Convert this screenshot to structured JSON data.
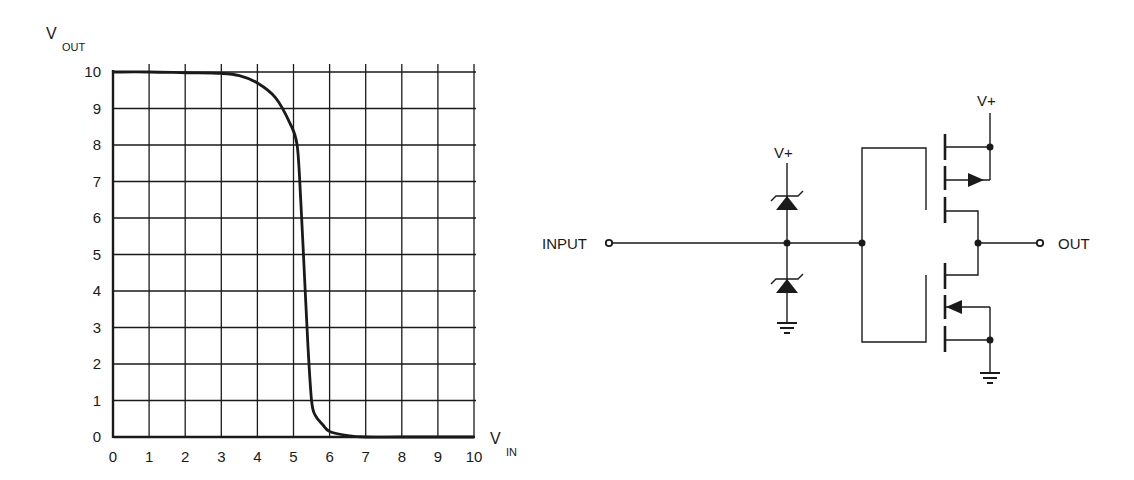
{
  "chart_data": {
    "type": "line",
    "title": "",
    "xlabel": "V",
    "xlabel_sub": "IN",
    "ylabel": "V",
    "ylabel_sub": "OUT",
    "xlim": [
      0,
      10
    ],
    "ylim": [
      0,
      10
    ],
    "grid": true,
    "xticks": [
      "0",
      "1",
      "2",
      "3",
      "4",
      "5",
      "6",
      "7",
      "8",
      "9",
      "10"
    ],
    "yticks": [
      "0",
      "1",
      "2",
      "3",
      "4",
      "5",
      "6",
      "7",
      "8",
      "9",
      "10"
    ],
    "series": [
      {
        "name": "Transfer characteristic",
        "x": [
          0,
          1,
          2,
          3,
          3.5,
          4,
          4.5,
          4.9,
          5.1,
          5.2,
          5.3,
          5.4,
          5.5,
          5.6,
          5.8,
          6.0,
          6.5,
          7.0,
          8,
          10
        ],
        "y": [
          10,
          10,
          9.98,
          9.96,
          9.9,
          9.7,
          9.3,
          8.6,
          8.0,
          6.5,
          4.5,
          2.5,
          1.0,
          0.6,
          0.35,
          0.15,
          0.04,
          0.0,
          0.0,
          0.0
        ]
      }
    ]
  },
  "circuit": {
    "input_label": "INPUT",
    "output_label": "OUT",
    "supply_label_diode": "V+",
    "supply_label_mosfet": "V+"
  },
  "colors": {
    "ink": "#1a1a1a",
    "background": "#ffffff"
  }
}
